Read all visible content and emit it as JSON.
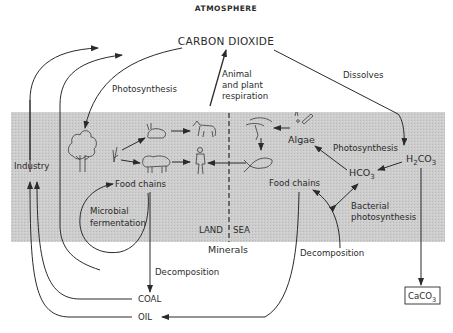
{
  "diagram": {
    "title": "ATMOSPHERE",
    "band_color": "#c9c9c9",
    "ink_color": "#2b2b2b",
    "nodes": {
      "carbon_dioxide": "CARBON DIOXIDE",
      "industry": "Industry",
      "food_chains_land": "Food  chains",
      "food_chains_sea": "Food  chains",
      "algae": "Algae",
      "hco3_base": "HCO",
      "hco3_sub": "3",
      "h2co3_h": "H",
      "h2co3_sub2": "2",
      "h2co3_co": "CO",
      "h2co3_sub3": "3",
      "caco3_base": "CaCO",
      "caco3_sub": "3",
      "coal": "COAL",
      "oil": "OIL",
      "minerals": "Minerals",
      "land": "LAND",
      "sea": "SEA"
    },
    "edge_labels": {
      "photosynthesis_land": "Photosynthesis",
      "respiration_line1": "Animal",
      "respiration_line2": "and plant",
      "respiration_line3": "respiration",
      "dissolves": "Dissolves",
      "photosynthesis_sea": "Photosynthesis",
      "microbial_line1": "Microbial",
      "microbial_line2": "fermentation",
      "bacterial_line1": "Bacterial",
      "bacterial_line2": "photosynthesis",
      "decomposition_land": "Decomposition",
      "decomposition_sea": "Decomposition"
    },
    "icons": [
      "tree-icon",
      "plant-sprig-icon",
      "rabbit-icon",
      "wolf-icon",
      "sheep-icon",
      "human-icon",
      "shrimp-icon",
      "plankton-icon",
      "fish-icon"
    ]
  }
}
